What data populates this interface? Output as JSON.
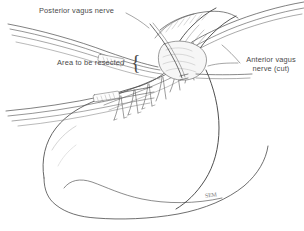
{
  "figure": {
    "background_color": "#ffffff",
    "ink_color": "#3b3b3b",
    "label_color": "#4a4a4a",
    "shade_color": "#8c8c8c",
    "width": 304,
    "height": 231
  },
  "labels": {
    "posterior_vagus": "Posterior vagus nerve",
    "area_resected": "Area to be resected",
    "anterior_vagus_line1": "Anterior vagus",
    "anterior_vagus_line2": "nerve (cut)",
    "brace": "{"
  },
  "signature": {
    "mark": "SEM"
  },
  "anatomy": {
    "structures": [
      "esophagogastric junction",
      "esophagus",
      "stomach fundus",
      "stomach body",
      "lesser curvature",
      "greater curvature",
      "posterior vagus nerve trunk",
      "anterior vagus nerve (cut)",
      "nerves of Latarjet branches",
      "left gastric vessels"
    ],
    "instruments": [
      "right-angle clamp upper bundle",
      "right-angle clamp lower bundle",
      "retractor shaft upper right",
      "retractor shaft lower right",
      "tissue retractor at hiatus"
    ]
  }
}
